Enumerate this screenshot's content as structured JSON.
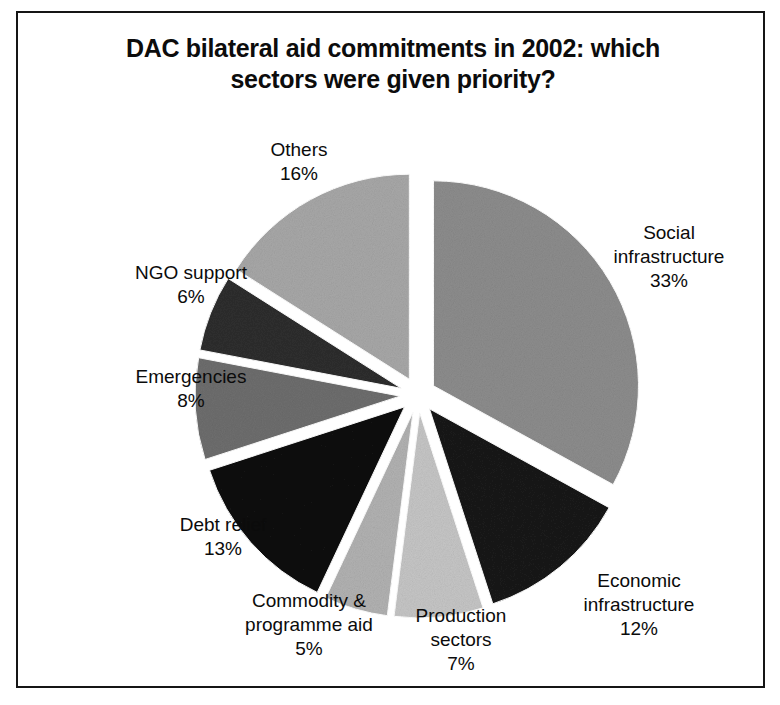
{
  "title": {
    "line1": "DAC bilateral aid commitments in 2002: which",
    "line2": "sectors were given priority?"
  },
  "chart_data": {
    "type": "pie",
    "title": "DAC bilateral aid commitments in 2002: which sectors were given priority?",
    "xlabel": "",
    "ylabel": "",
    "unit": "percent",
    "exploded": true,
    "start_angle_deg": 0,
    "direction": "clockwise",
    "legend": "none (labels placed outside slices)",
    "grid": false,
    "categories": [
      "Social infrastructure",
      "Economic infrastructure",
      "Production sectors",
      "Commodity & programme aid",
      "Debt relief",
      "Emergencies",
      "NGO support",
      "Others"
    ],
    "values": [
      33,
      12,
      7,
      5,
      13,
      8,
      6,
      16
    ],
    "value_labels": [
      "33%",
      "12%",
      "7%",
      "5%",
      "13%",
      "8%",
      "6%",
      "16%"
    ],
    "colors": [
      "#8d8d8d",
      "#1a1a1a",
      "#c6c6c6",
      "#b2b2b2",
      "#121212",
      "#6e6e6e",
      "#2e2e2e",
      "#a8a8a8"
    ],
    "total": 100,
    "slices": [
      {
        "label": "Social infrastructure",
        "label_line1": "Social",
        "label_line2": "infrastructure",
        "value": 33,
        "value_label": "33%",
        "color": "#8d8d8d"
      },
      {
        "label": "Economic infrastructure",
        "label_line1": "Economic",
        "label_line2": "infrastructure",
        "value": 12,
        "value_label": "12%",
        "color": "#1a1a1a"
      },
      {
        "label": "Production sectors",
        "label_line1": "Production",
        "label_line2": "sectors",
        "value": 7,
        "value_label": "7%",
        "color": "#c6c6c6"
      },
      {
        "label": "Commodity & programme aid",
        "label_line1": "Commodity &",
        "label_line2": "programme aid",
        "value": 5,
        "value_label": "5%",
        "color": "#b2b2b2"
      },
      {
        "label": "Debt relief",
        "label_line1": "Debt relief",
        "label_line2": "",
        "value": 13,
        "value_label": "13%",
        "color": "#121212"
      },
      {
        "label": "Emergencies",
        "label_line1": "Emergencies",
        "label_line2": "",
        "value": 8,
        "value_label": "8%",
        "color": "#6e6e6e"
      },
      {
        "label": "NGO support",
        "label_line1": "NGO support",
        "label_line2": "",
        "value": 6,
        "value_label": "6%",
        "color": "#2e2e2e"
      },
      {
        "label": "Others",
        "label_line1": "Others",
        "label_line2": "",
        "value": 16,
        "value_label": "16%",
        "color": "#a8a8a8"
      }
    ]
  },
  "frame": {
    "border_color": "#151515"
  }
}
